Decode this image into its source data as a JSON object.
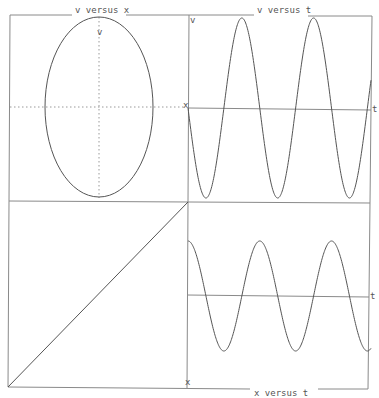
{
  "chart_data": [
    {
      "type": "line",
      "panel": "top-left",
      "title": "v versus x",
      "xlabel": "x",
      "ylabel": "v",
      "description": "Phase portrait: closed ellipse centered at origin, taller than wide",
      "x_semi_axis": 1.0,
      "y_semi_axis": 1.67,
      "grid": "dotted axes through origin"
    },
    {
      "type": "line",
      "panel": "top-right",
      "title": "v versus t",
      "xlabel": "t",
      "ylabel": "v",
      "description": "Sinusoid starting at 0 going negative (-sin), about 2.5 periods shown",
      "x": [
        0,
        0.5,
        1.0,
        1.5,
        2.0,
        2.5
      ],
      "values": [
        0,
        -1,
        0,
        1,
        0,
        -1
      ],
      "amplitude": 1,
      "periods_shown": 2.55
    },
    {
      "type": "line",
      "panel": "bottom-left",
      "title": "",
      "description": "Straight diagonal line from bottom-left to top-right corner",
      "x": [
        0,
        1
      ],
      "values": [
        0,
        1
      ]
    },
    {
      "type": "line",
      "panel": "bottom-right",
      "title": "x versus t",
      "xlabel": "t",
      "ylabel": "x",
      "description": "Cosine starting at maximum, about 2.5 periods shown, amplitude ~0.6 of v",
      "x": [
        0,
        0.5,
        1.0,
        1.5,
        2.0,
        2.5
      ],
      "values": [
        1,
        -1,
        1,
        -1,
        1,
        -1
      ],
      "amplitude": 0.6,
      "periods_shown": 2.55
    }
  ],
  "labels": {
    "top_left_title": "v versus x",
    "top_left_v": "v",
    "top_left_x": "x",
    "top_right_title": "v versus t",
    "top_right_v": "v",
    "top_right_t": "t",
    "bottom_right_t": "t",
    "bottom_right_x": "x",
    "bottom_title": "x versus t"
  }
}
